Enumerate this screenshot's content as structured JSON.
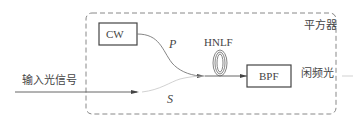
{
  "diagram": {
    "container_label": "平方器",
    "blocks": {
      "cw": "CW",
      "bpf": "BPF",
      "hnlf": "HNLF"
    },
    "signals": {
      "pump": "P",
      "signal": "S"
    },
    "input_label": "输入光信号",
    "output_label": "闲频光",
    "colors": {
      "stroke": "#555555",
      "dash": "#888888",
      "faint": "#cccccc"
    }
  }
}
